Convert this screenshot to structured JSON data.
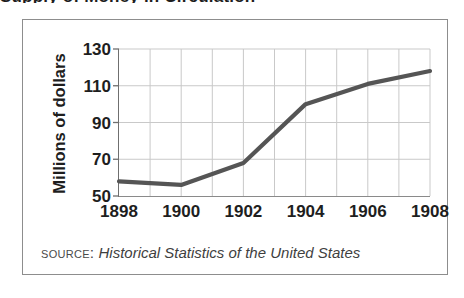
{
  "figure": {
    "cutoff_headline": "Supply of Money in Circulation",
    "y_axis_title": "Millions of dollars",
    "source_label": "Source:",
    "source_title": "Historical Statistics of the United States"
  },
  "colors": {
    "line": "#555555",
    "grid": "#c9c9c9",
    "axis": "#6f6f6f",
    "frame": "#8d8d8d",
    "text": "#1e1e1e",
    "source_text": "#4a4a4a"
  },
  "chart_data": {
    "type": "line",
    "title": "",
    "xlabel": "",
    "ylabel": "Millions of dollars",
    "x": [
      1898,
      1899,
      1900,
      1901,
      1902,
      1903,
      1904,
      1905,
      1906,
      1907,
      1908
    ],
    "values": [
      58,
      57,
      56,
      62,
      68,
      84,
      100,
      106,
      111,
      115,
      118
    ],
    "series": [
      {
        "name": "Millions of dollars",
        "values": [
          58,
          57,
          56,
          62,
          68,
          84,
          100,
          106,
          111,
          115,
          118
        ]
      }
    ],
    "vertices": [
      {
        "x": 1898,
        "y": 58
      },
      {
        "x": 1900,
        "y": 56
      },
      {
        "x": 1902,
        "y": 68
      },
      {
        "x": 1904,
        "y": 100
      },
      {
        "x": 1906,
        "y": 111
      },
      {
        "x": 1908,
        "y": 118
      }
    ],
    "xlim": [
      1898,
      1908
    ],
    "ylim": [
      50,
      130
    ],
    "ytick_labels": [
      "130",
      "110",
      "90",
      "70",
      "50"
    ],
    "ytick_values": [
      130,
      110,
      90,
      70,
      50
    ],
    "xtick_labels": [
      "1898",
      "1900",
      "1902",
      "1904",
      "1906",
      "1908"
    ],
    "xtick_values": [
      1898,
      1900,
      1902,
      1904,
      1906,
      1908
    ],
    "xgrid_values": [
      1899,
      1900,
      1901,
      1902,
      1903,
      1904,
      1905,
      1906,
      1907,
      1908
    ],
    "grid": true,
    "legend": false,
    "legend_position": "none"
  }
}
